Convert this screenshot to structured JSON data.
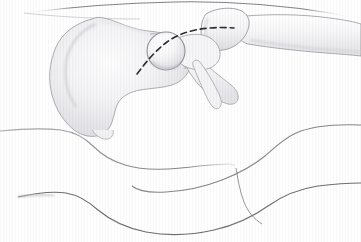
{
  "figure": {
    "title": "Lateral view of hip joint with surgical incision line",
    "background_color": "#ffffff",
    "width": 361,
    "height": 242,
    "view": "lateral"
  },
  "palette": {
    "outline": "#8c8c90",
    "outline_dark": "#5a5a5e",
    "bone_fill_light": "#fbfbfc",
    "bone_fill_mid": "#f0f0f2",
    "bone_shadow": "#d9d9dd",
    "body_contour": "#6e6e72",
    "incision_dash": "#2e2e32",
    "background": "#ffffff"
  },
  "structures": [
    {
      "id": "ilium",
      "label": "Ilium (pelvis)",
      "interactable": false
    },
    {
      "id": "acetabular-rim",
      "label": "Acetabular rim",
      "interactable": false
    },
    {
      "id": "ischium",
      "label": "Ischium",
      "interactable": false
    },
    {
      "id": "femoral-head",
      "label": "Femoral head",
      "interactable": false
    },
    {
      "id": "femoral-neck",
      "label": "Femoral neck",
      "interactable": false
    },
    {
      "id": "greater-trochanter",
      "label": "Greater trochanter",
      "interactable": false
    },
    {
      "id": "lesser-trochanter",
      "label": "Lesser trochanter",
      "interactable": false
    },
    {
      "id": "femoral-shaft",
      "label": "Femoral shaft",
      "interactable": false
    }
  ],
  "annotations": {
    "incision_line": {
      "name": "incision-dashed-line",
      "style": "dashed",
      "color": "#2e2e32",
      "stroke_width": 1.6,
      "dash_pattern": "6 4",
      "start": {
        "x": 137,
        "y": 74
      },
      "end": {
        "x": 234,
        "y": 28
      },
      "description": "Curved dashed posterior approach incision crossing the femoral neck"
    }
  },
  "body_contours": [
    {
      "id": "upper-torso-contour",
      "label": "Upper torso contour"
    },
    {
      "id": "flank-contour",
      "label": "Flank contour"
    },
    {
      "id": "gluteal-fold-contour",
      "label": "Gluteal fold contour"
    },
    {
      "id": "thigh-upper-contour",
      "label": "Upper thigh contour"
    },
    {
      "id": "thigh-lower-contour",
      "label": "Lower thigh contour"
    }
  ],
  "texture": {
    "name": "vertical-scanline-texture",
    "visible": true,
    "opacity": 0.03
  }
}
